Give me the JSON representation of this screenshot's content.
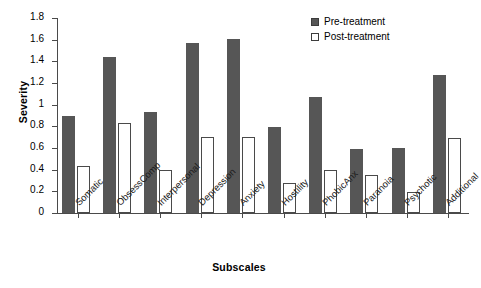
{
  "chart_data": {
    "type": "bar",
    "title": "",
    "xlabel": "Subscales",
    "ylabel": "Severity",
    "ylim": [
      0,
      1.8
    ],
    "yticks": [
      0,
      0.2,
      0.4,
      0.6,
      0.8,
      1,
      1.2,
      1.4,
      1.6,
      1.8
    ],
    "ytick_labels": [
      "0",
      "0.2",
      "0.4",
      "0.6",
      "0.8",
      "1",
      "1.2",
      "1.4",
      "1.6",
      "1.8"
    ],
    "grid": false,
    "legend_position": "top-right",
    "categories": [
      "Somatic",
      "ObsessComp",
      "Interpersonal",
      "Depression",
      "Anxiety",
      "Hostility",
      "PhobicAnx",
      "Paranoia",
      "Psychotic",
      "Additional"
    ],
    "series": [
      {
        "name": "Pre-treatment",
        "color": "#565656",
        "values": [
          0.9,
          1.44,
          0.93,
          1.57,
          1.61,
          0.79,
          1.07,
          0.59,
          0.6,
          1.27
        ]
      },
      {
        "name": "Post-treatment",
        "color": "#ffffff",
        "values": [
          0.43,
          0.83,
          0.4,
          0.7,
          0.7,
          0.28,
          0.4,
          0.35,
          0.19,
          0.69
        ]
      }
    ]
  },
  "axis": {
    "y_title": "Severity",
    "x_title": "Subscales"
  },
  "colors": {
    "pre_fill": "#565656",
    "post_fill": "#ffffff",
    "axis": "#4a4a4a",
    "background": "#ffffff"
  }
}
